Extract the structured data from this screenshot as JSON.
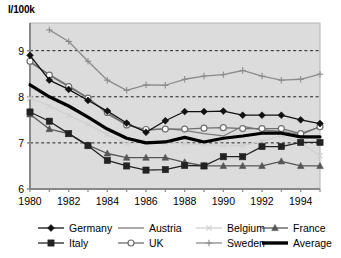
{
  "chart_data": {
    "type": "line",
    "title": "",
    "ylabel": "I/100k",
    "xlabel": "",
    "ylim": [
      6,
      9.6
    ],
    "xlim": [
      1980,
      1995
    ],
    "yticks": [
      6,
      7,
      8,
      9
    ],
    "xticks": [
      1980,
      1982,
      1984,
      1986,
      1988,
      1990,
      1992,
      1994
    ],
    "grid": "horizontal-dashed",
    "legend_position": "bottom",
    "x": [
      1980,
      1981,
      1982,
      1983,
      1984,
      1985,
      1986,
      1987,
      1988,
      1989,
      1990,
      1991,
      1992,
      1993,
      1994,
      1995
    ],
    "series": [
      {
        "name": "Germany",
        "marker": "filled-diamond",
        "color": "#111111",
        "values": [
          8.9,
          8.36,
          8.16,
          7.92,
          7.69,
          7.43,
          7.23,
          7.48,
          7.68,
          7.68,
          7.69,
          7.6,
          7.6,
          7.6,
          7.5,
          7.42
        ]
      },
      {
        "name": "Italy",
        "marker": "filled-square",
        "color": "#222222",
        "values": [
          7.67,
          7.47,
          7.2,
          6.94,
          6.62,
          6.5,
          6.41,
          6.42,
          6.51,
          6.5,
          6.7,
          6.7,
          6.92,
          6.92,
          7.01,
          7.01
        ]
      },
      {
        "name": "Austria",
        "marker": "none",
        "color": "#7a7a7a",
        "values": [
          8.75,
          8.48,
          8.24,
          7.98,
          7.63,
          7.39,
          7.27,
          7.31,
          7.27,
          7.2,
          7.15,
          7.36,
          7.28,
          7.25,
          7.18,
          7.35
        ]
      },
      {
        "name": "UK",
        "marker": "open-circle",
        "color": "#6e6e6e",
        "values": [
          8.77,
          8.47,
          8.22,
          7.97,
          7.66,
          7.39,
          7.29,
          7.3,
          7.3,
          7.32,
          7.33,
          7.31,
          7.31,
          7.31,
          7.2,
          7.35
        ]
      },
      {
        "name": "Belgium",
        "marker": "x",
        "color": "#cfcfcf",
        "values": [
          7.97,
          7.8,
          7.6,
          7.4,
          7.18,
          6.98,
          7.0,
          7.0,
          6.98,
          6.96,
          6.94,
          6.94,
          7.04,
          7.16,
          7.0,
          6.72
        ]
      },
      {
        "name": "Sweden",
        "marker": "plus",
        "color": "#8c8c8c",
        "values": [
          null,
          9.45,
          9.2,
          8.77,
          8.36,
          8.14,
          8.26,
          8.25,
          8.38,
          8.45,
          8.48,
          8.57,
          8.45,
          8.36,
          8.38,
          8.49
        ]
      },
      {
        "name": "France",
        "marker": "filled-triangle",
        "color": "#565656",
        "values": [
          7.62,
          7.3,
          7.2,
          6.95,
          6.77,
          6.68,
          6.68,
          6.68,
          6.58,
          6.5,
          6.5,
          6.5,
          6.5,
          6.6,
          6.5,
          6.5
        ]
      },
      {
        "name": "Average",
        "marker": "none",
        "color": "#000000",
        "thick": true,
        "values": [
          8.26,
          8.0,
          7.8,
          7.56,
          7.3,
          7.1,
          7.0,
          7.02,
          7.12,
          7.02,
          7.1,
          7.15,
          7.21,
          7.21,
          7.13,
          7.13
        ]
      }
    ]
  },
  "legend": {
    "entries": [
      {
        "label": "Germany"
      },
      {
        "label": "Austria"
      },
      {
        "label": "Belgium"
      },
      {
        "label": "France"
      },
      {
        "label": "Italy"
      },
      {
        "label": "UK"
      },
      {
        "label": "Sweden"
      },
      {
        "label": "Average"
      }
    ]
  },
  "colors": {
    "plot_background": "#dcdcdc",
    "frame": "#888888",
    "gridline": "#222222",
    "page_background": "#ffffff"
  }
}
